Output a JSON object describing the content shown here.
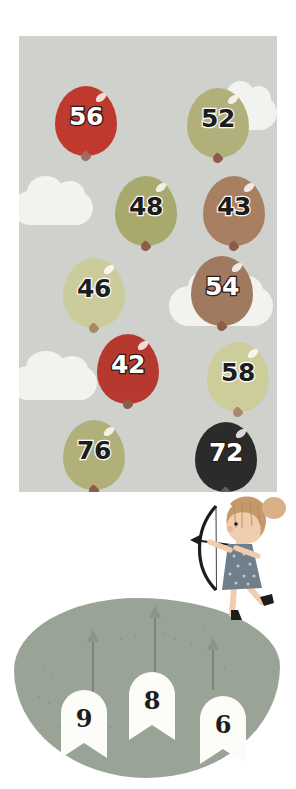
{
  "page": {
    "background_color": "#ffffff"
  },
  "sky": {
    "name": "sky-panel",
    "color": "#cfd2cc",
    "clouds": [
      {
        "id": "cloud-right-top",
        "x": 196,
        "y": 60,
        "w": 62,
        "h": 34
      },
      {
        "id": "cloud-left-mid",
        "x": -6,
        "y": 155,
        "w": 80,
        "h": 34
      },
      {
        "id": "cloud-right-mid",
        "x": 150,
        "y": 250,
        "w": 104,
        "h": 40
      },
      {
        "id": "cloud-left-low",
        "x": -8,
        "y": 330,
        "w": 86,
        "h": 34
      }
    ]
  },
  "balloons": [
    {
      "number": "56",
      "color": "#c0392f",
      "knot": "#9e6e5e",
      "dark": true,
      "x": 36,
      "y": 50
    },
    {
      "number": "52",
      "color": "#b2b07a",
      "knot": "#8e5b4b",
      "dark": false,
      "x": 168,
      "y": 52
    },
    {
      "number": "48",
      "color": "#a8a96c",
      "knot": "#8e5b4b",
      "dark": false,
      "x": 96,
      "y": 140
    },
    {
      "number": "43",
      "color": "#a97f62",
      "knot": "#8e5b4b",
      "dark": false,
      "x": 184,
      "y": 140
    },
    {
      "number": "46",
      "color": "#cbcb9c",
      "knot": "#a88a6a",
      "dark": false,
      "x": 44,
      "y": 222
    },
    {
      "number": "54",
      "color": "#a07a5e",
      "knot": "#8e5b4b",
      "dark": true,
      "x": 172,
      "y": 220
    },
    {
      "number": "42",
      "color": "#b5392f",
      "knot": "#8e5b4b",
      "dark": true,
      "x": 78,
      "y": 298
    },
    {
      "number": "58",
      "color": "#cdcd9c",
      "knot": "#a88a6a",
      "dark": false,
      "x": 188,
      "y": 306
    },
    {
      "number": "76",
      "color": "#b2b07a",
      "knot": "#8e5b4b",
      "dark": false,
      "x": 44,
      "y": 384
    },
    {
      "number": "72",
      "color": "#2b2b2b",
      "knot": "#6b5b4b",
      "dark": true,
      "x": 176,
      "y": 386
    }
  ],
  "ground": {
    "name": "ground-blob",
    "color": "#9aa496",
    "arrows": [
      {
        "id": "ground-arrow-1",
        "x": 78,
        "y": 42,
        "h": 52
      },
      {
        "id": "ground-arrow-2",
        "x": 140,
        "y": 18,
        "h": 56
      },
      {
        "id": "ground-arrow-3",
        "x": 198,
        "y": 50,
        "h": 42
      }
    ]
  },
  "banners": [
    {
      "number": "9",
      "x": 47,
      "y": 92
    },
    {
      "number": "8",
      "x": 115,
      "y": 74
    },
    {
      "number": "6",
      "x": 186,
      "y": 98
    }
  ],
  "girl": {
    "name": "archer-girl",
    "hair_color": "#c59a6a",
    "dress_color": "#6f7f8c",
    "skin_color": "#efc9a8",
    "bow_color": "#1d1d1b",
    "boot_color": "#1d1d1b",
    "label": "girl with bow and arrow"
  }
}
